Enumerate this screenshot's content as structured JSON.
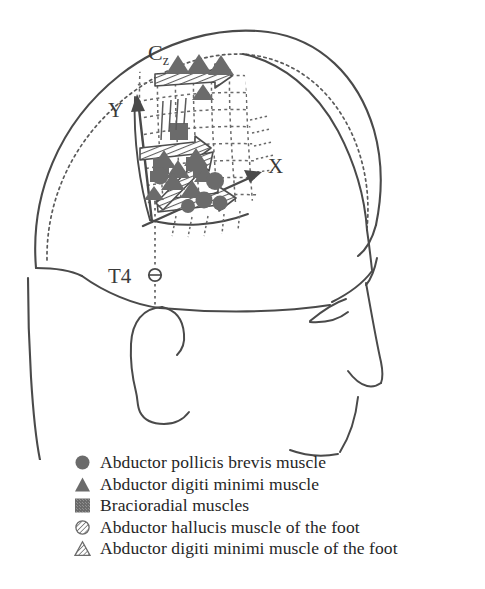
{
  "figure": {
    "colors": {
      "outline": "#4a4a4a",
      "marker_fill": "#6b6b6b",
      "hatch_stroke": "#5a5a5a",
      "text": "#262626",
      "background": "#ffffff"
    }
  },
  "head_diagram": {
    "labels": {
      "vertex_electrode": "C",
      "vertex_electrode_sub": "z",
      "temporal_electrode": "T4",
      "axis_x": "X",
      "axis_y": "Y"
    },
    "annotations": {
      "vertex_marker": "cz-reference-point",
      "temporal_marker": "t4-electrode-circle",
      "grid": "stimulation-grid",
      "arrows": [
        "hatched-arrow-top",
        "hatched-arrow-middle",
        "hatched-arrow-bottom",
        "hatched-arrow-diagonal"
      ]
    }
  },
  "legend": {
    "items": [
      {
        "marker": "filled-circle",
        "label": "Abductor pollicis brevis muscle"
      },
      {
        "marker": "filled-triangle",
        "label": "Abductor digiti minimi muscle"
      },
      {
        "marker": "filled-square",
        "label": "Bracioradial muscles"
      },
      {
        "marker": "hatched-circle",
        "label": "Abductor hallucis muscle of the foot"
      },
      {
        "marker": "hatched-triangle",
        "label": "Abductor digiti minimi muscle of the foot"
      }
    ]
  }
}
